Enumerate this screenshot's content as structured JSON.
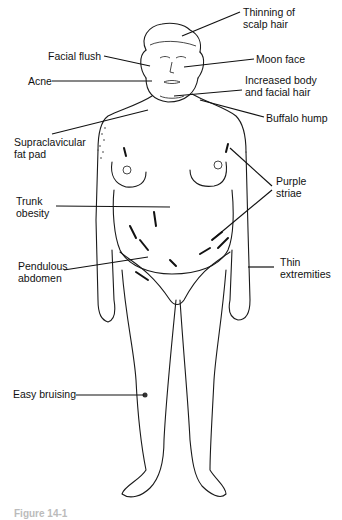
{
  "figure": {
    "caption": "Figure 14-1",
    "labels": [
      {
        "id": "thinning-scalp-hair",
        "text": "Thinning of\nscalp hair",
        "x": 243,
        "y": 6
      },
      {
        "id": "facial-flush",
        "text": "Facial flush",
        "x": 48,
        "y": 50
      },
      {
        "id": "moon-face",
        "text": "Moon face",
        "x": 256,
        "y": 53
      },
      {
        "id": "acne",
        "text": "Acne",
        "x": 28,
        "y": 75
      },
      {
        "id": "increased-body-facial-hair",
        "text": "Increased body\nand facial hair",
        "x": 245,
        "y": 74
      },
      {
        "id": "buffalo-hump",
        "text": "Buffalo hump",
        "x": 266,
        "y": 112
      },
      {
        "id": "supraclavicular-fat-pad",
        "text": "Supraclavicular\nfat pad",
        "x": 14,
        "y": 136
      },
      {
        "id": "purple-striae",
        "text": "Purple\nstriae",
        "x": 276,
        "y": 175
      },
      {
        "id": "trunk-obesity",
        "text": "Trunk\nobesity",
        "x": 16,
        "y": 195
      },
      {
        "id": "pendulous-abdomen",
        "text": "Pendulous\nabdomen",
        "x": 18,
        "y": 260
      },
      {
        "id": "thin-extremities",
        "text": "Thin\nextremities",
        "x": 280,
        "y": 256
      },
      {
        "id": "easy-bruising",
        "text": "Easy bruising",
        "x": 13,
        "y": 388
      }
    ]
  },
  "colors": {
    "line": "#111111",
    "background": "#ffffff"
  }
}
